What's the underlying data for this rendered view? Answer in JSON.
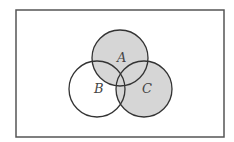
{
  "diagram": {
    "type": "venn",
    "title": "",
    "universe": {
      "x": 16,
      "y": 10,
      "width": 208,
      "height": 127
    },
    "sets": [
      {
        "name": "A",
        "label": "A",
        "cx": 120,
        "cy": 58,
        "r": 28,
        "label_x": 117,
        "label_y": 62
      },
      {
        "name": "B",
        "label": "B",
        "cx": 97,
        "cy": 89,
        "r": 28,
        "label_x": 94,
        "label_y": 93
      },
      {
        "name": "C",
        "label": "C",
        "cx": 144,
        "cy": 89,
        "r": 28,
        "label_x": 142,
        "label_y": 93
      }
    ],
    "shaded_region": "A ∪ C",
    "colors": {
      "shade": "#d6d6d6",
      "stroke": "#333333",
      "frame": "#555555",
      "background": "#ffffff"
    }
  }
}
